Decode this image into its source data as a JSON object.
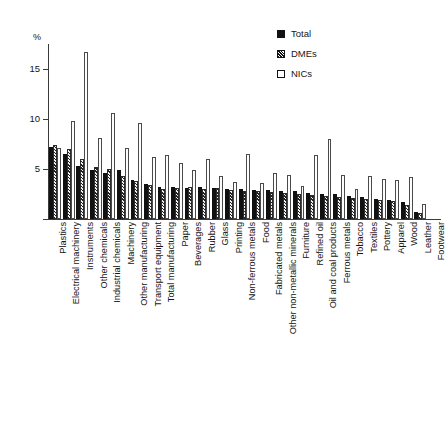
{
  "chart_data": {
    "type": "bar",
    "title": "",
    "subtitle": "",
    "xlabel": "",
    "ylabel": "%",
    "ylim": [
      0,
      17.5
    ],
    "yticks": [
      0,
      5,
      10,
      15
    ],
    "ytick_labels": [
      "",
      "5",
      "10",
      "15"
    ],
    "grid": false,
    "legend_position": "top-right",
    "orientation": "vertical",
    "categories": [
      "Plastics",
      "Electrical machinery",
      "Instruments",
      "Other chemicals",
      "Industrial chemicals",
      "Machinery",
      "Other manufacturing",
      "Transport equipment",
      "Total manufacturing",
      "Paper",
      "Beverages",
      "Rubber",
      "Glass",
      "Printing",
      "Non-ferrous metals",
      "Food",
      "Fabricated metals",
      "Other non-metallic minerals",
      "Furniture",
      "Refined oil",
      "Oil and coal products",
      "Ferrous metals",
      "Tobacco",
      "Textiles",
      "Pottery",
      "Apparel",
      "Wood",
      "Leather",
      "Footwear"
    ],
    "series": [
      {
        "name": "Total",
        "values": [
          7.2,
          6.5,
          5.3,
          4.9,
          4.6,
          4.9,
          3.9,
          3.5,
          3.2,
          3.2,
          3.1,
          3.2,
          3.1,
          3.0,
          3.0,
          2.9,
          2.9,
          2.8,
          2.8,
          2.6,
          2.5,
          2.5,
          2.3,
          2.2,
          2.0,
          1.9,
          1.7,
          0.7,
          0.0
        ]
      },
      {
        "name": "DMEs",
        "values": [
          7.4,
          7.0,
          6.0,
          5.2,
          5.0,
          4.3,
          3.8,
          3.4,
          3.0,
          3.1,
          3.2,
          3.0,
          3.1,
          2.9,
          2.8,
          2.8,
          2.7,
          2.6,
          2.5,
          2.4,
          2.3,
          2.2,
          2.1,
          2.0,
          1.9,
          1.8,
          1.4,
          0.6,
          0.0
        ]
      },
      {
        "name": "NICs",
        "values": [
          7.1,
          9.8,
          16.7,
          8.1,
          10.6,
          7.1,
          9.6,
          6.2,
          6.4,
          5.6,
          4.9,
          6.0,
          4.3,
          3.7,
          6.5,
          3.6,
          4.6,
          4.4,
          3.3,
          6.4,
          8.0,
          4.4,
          3.0,
          4.3,
          4.0,
          3.9,
          4.2,
          1.5,
          0.0
        ]
      }
    ],
    "legend": [
      {
        "label": "Total",
        "swatch": "filled-black",
        "swatch_class": "sw-total"
      },
      {
        "label": "DMEs",
        "swatch": "hatched",
        "swatch_class": "sw-dmes"
      },
      {
        "label": "NICs",
        "swatch": "white-outline",
        "swatch_class": "sw-nics"
      }
    ]
  }
}
